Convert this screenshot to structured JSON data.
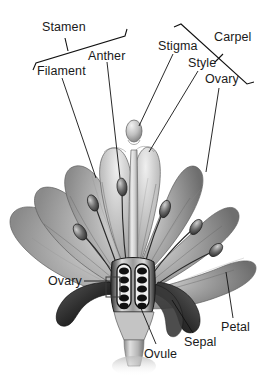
{
  "diagram": {
    "style": "grayscale botanical illustration",
    "background_color": "#ffffff",
    "ink_color": "#1a1a1a",
    "width": 267,
    "height": 375
  },
  "labels": {
    "stamen": "Stamen",
    "anther": "Anther",
    "filament": "Filament",
    "stigma": "Stigma",
    "style": "Style",
    "carpel": "Carpel",
    "ovary_top_right": "Ovary",
    "ovary_bottom_left": "Ovary",
    "ovule": "Ovule",
    "sepal": "Sepal",
    "petal": "Petal"
  },
  "structures": {
    "groups": [
      {
        "name": "Stamen",
        "bracket": "left-top",
        "parts": [
          "Anther",
          "Filament"
        ]
      },
      {
        "name": "Carpel",
        "bracket": "right-top",
        "parts": [
          "Stigma",
          "Style",
          "Ovary"
        ]
      }
    ],
    "other_parts": [
      "Petal",
      "Sepal",
      "Ovule",
      "Ovary"
    ]
  },
  "colors": {
    "petal_light": "#d8d8d8",
    "petal_mid": "#a9a9a9",
    "petal_dark": "#6f6f6f",
    "petal_shadow": "#4a4a4a",
    "sepal_dark": "#2e2e2e",
    "ovule_fill": "#141414",
    "style_light": "#e4e4e4",
    "leader_line": "#111111"
  },
  "ovary_detail": {
    "chambers": 2,
    "ovules_per_chamber": 5,
    "ovule_shape": "oval"
  }
}
